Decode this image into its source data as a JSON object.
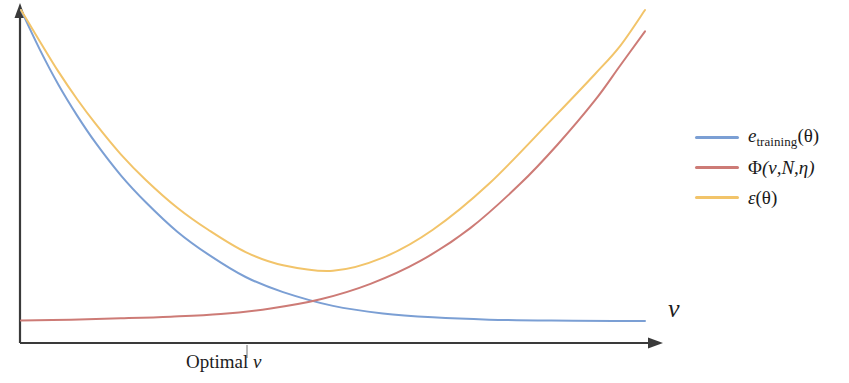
{
  "figure": {
    "background_color": "#ffffff",
    "axis_color": "#3a3a3a"
  },
  "axes": {
    "x_label": "ν",
    "x_label_name": "nu",
    "y_label": "",
    "origin_px": [
      20,
      343
    ],
    "x_end_px": [
      660,
      343
    ],
    "y_end_px": [
      20,
      8
    ]
  },
  "annotations": {
    "optimal_prefix": "Optimal ",
    "optimal_symbol": "ν",
    "optimal_tick_x_px": 247
  },
  "legend": {
    "position": "right",
    "items": [
      {
        "name": "training-error",
        "color": "#7b9fd4",
        "base": "e",
        "subscript": "training",
        "argument": "(θ)"
      },
      {
        "name": "complexity-penalty",
        "color": "#cd7b76",
        "base": "Φ",
        "subscript": "",
        "argument": "(ν,N,η)"
      },
      {
        "name": "total-error",
        "color": "#f2c46a",
        "base": "ε",
        "subscript": "",
        "argument": "(θ)"
      }
    ]
  },
  "chart_data": {
    "type": "line",
    "title": "",
    "xlabel": "ν",
    "ylabel": "",
    "grid": false,
    "legend_position": "right",
    "xlim": [
      0,
      1
    ],
    "ylim": [
      0,
      1
    ],
    "x_axis_is_arrow": true,
    "y_axis_is_arrow": true,
    "annotation": "Optimal ν",
    "annotation_x": 0.355,
    "curve_crossing_point": [
      0.355,
      0.068
    ],
    "total_error_minimum": [
      0.368,
      0.214
    ],
    "series": [
      {
        "name": "e_training(θ)",
        "label": "e_training(θ)",
        "color": "#7b9fd4",
        "shape": "monotonic decreasing exponential decay",
        "x": [
          0.0,
          0.03,
          0.06,
          0.09,
          0.12,
          0.16,
          0.2,
          0.25,
          0.3,
          0.36,
          0.42,
          0.5,
          0.58,
          0.66,
          0.75,
          0.85,
          0.95,
          1.0
        ],
        "y": [
          1.0,
          0.88,
          0.772,
          0.678,
          0.594,
          0.496,
          0.414,
          0.325,
          0.255,
          0.186,
          0.14,
          0.098,
          0.075,
          0.063,
          0.056,
          0.053,
          0.052,
          0.052
        ]
      },
      {
        "name": "Φ(ν,N,η)",
        "label": "Φ(ν,N,η)",
        "color": "#cd7b76",
        "shape": "monotonic increasing exponential growth",
        "x": [
          0.0,
          0.08,
          0.16,
          0.24,
          0.32,
          0.4,
          0.48,
          0.56,
          0.64,
          0.72,
          0.8,
          0.86,
          0.92,
          0.96,
          1.0
        ],
        "y": [
          0.053,
          0.056,
          0.06,
          0.065,
          0.073,
          0.09,
          0.118,
          0.165,
          0.235,
          0.335,
          0.47,
          0.59,
          0.725,
          0.83,
          0.935
        ]
      },
      {
        "name": "ε(θ)",
        "label": "ε(θ)",
        "color": "#f2c46a",
        "shape": "U-shaped sum of the two other curves",
        "x": [
          0.0,
          0.03,
          0.06,
          0.09,
          0.12,
          0.16,
          0.2,
          0.25,
          0.3,
          0.36,
          0.42,
          0.5,
          0.58,
          0.66,
          0.75,
          0.85,
          0.92,
          0.96,
          1.0
        ],
        "y": [
          1.0,
          0.905,
          0.812,
          0.728,
          0.652,
          0.56,
          0.482,
          0.398,
          0.33,
          0.262,
          0.222,
          0.205,
          0.245,
          0.33,
          0.47,
          0.665,
          0.805,
          0.89,
          1.0
        ]
      }
    ]
  }
}
